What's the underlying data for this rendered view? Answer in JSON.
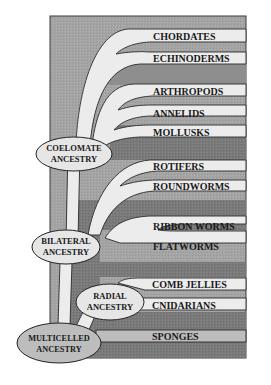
{
  "diagram": {
    "type": "phylogenetic-tree",
    "colors": {
      "background": "#a9a9a9",
      "dark_band": "#7c7c7c",
      "branch": "#ececec",
      "node_fill": "#e6e6e6",
      "root_node_fill": "#bdbdbd",
      "outline": "#222222"
    },
    "nodes": {
      "coelomate": {
        "line1": "COELOMATE",
        "line2": "ANCESTRY"
      },
      "bilateral": {
        "line1": "BILATERAL",
        "line2": "ANCESTRY"
      },
      "radial": {
        "line1": "RADIAL",
        "line2": "ANCESTRY"
      },
      "multicelled": {
        "line1": "MULTICELLED",
        "line2": "ANCESTRY"
      }
    },
    "taxa": [
      {
        "label": "CHORDATES",
        "ancestor": "coelomate"
      },
      {
        "label": "ECHINODERMS",
        "ancestor": "coelomate"
      },
      {
        "label": "ARTHROPODS",
        "ancestor": "coelomate"
      },
      {
        "label": "ANNELIDS",
        "ancestor": "coelomate"
      },
      {
        "label": "MOLLUSKS",
        "ancestor": "coelomate"
      },
      {
        "label": "ROTIFERS",
        "ancestor": "bilateral"
      },
      {
        "label": "ROUNDWORMS",
        "ancestor": "bilateral"
      },
      {
        "label": "RIBBON WORMS",
        "ancestor": "bilateral"
      },
      {
        "label": "FLATWORMS",
        "ancestor": "bilateral"
      },
      {
        "label": "COMB JELLIES",
        "ancestor": "radial"
      },
      {
        "label": "CNIDARIANS",
        "ancestor": "radial"
      },
      {
        "label": "SPONGES",
        "ancestor": "multicelled"
      }
    ]
  }
}
